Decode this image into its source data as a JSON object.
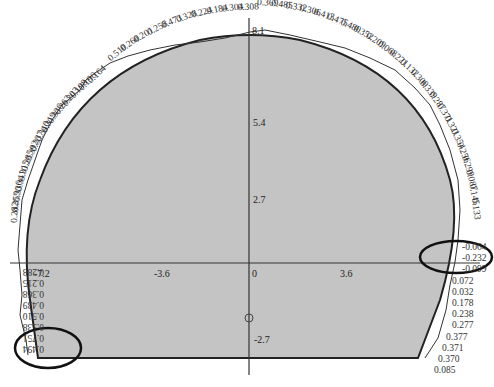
{
  "diagram": {
    "type": "tunnel-cross-section-deformation",
    "colors": {
      "fill": "#c4c4c4",
      "outline": "#222222",
      "axis": "#333333",
      "deformation_line": "#333333",
      "highlight_ellipse": "#111111"
    },
    "axes": {
      "x_ticks": [
        "-7.2",
        "-3.6",
        "0",
        "3.6"
      ],
      "y_ticks": [
        "8.1",
        "5.4",
        "2.7",
        "0",
        "-2.7"
      ],
      "origin_label": "0"
    },
    "labels_left_top": [
      "0.510",
      "0.260",
      "0.201",
      "0.258",
      "0.473",
      "0.328",
      "0.224",
      "0.184",
      "0.304",
      "0.308"
    ],
    "labels_top_right": [
      "0.369",
      "0.485",
      "0.332",
      "0.306",
      "0.413",
      "0.475",
      "0.480",
      "0.352",
      "0.209",
      "0.068",
      "0.221",
      "0.132",
      "0.300",
      "0.339",
      "0.287",
      "0.371",
      "0.321",
      "0.354",
      "0.256",
      "0.299",
      "0.087",
      "0.145",
      "0.133"
    ],
    "labels_right_lower": [
      "-0.064",
      "-0.232",
      "-0.099",
      "0.072",
      "0.032",
      "0.178",
      "0.238",
      "0.277",
      "0.377",
      "0.371",
      "0.370",
      "0.085"
    ],
    "labels_left_upper": [
      "0.164",
      "0.196",
      "0.198",
      "0.203",
      "0.263",
      "0.336",
      "0.319",
      "0.340",
      "0.337",
      "0.392",
      "0.285",
      "0.315",
      "0.341",
      "0.336",
      "0.359",
      "0.282"
    ],
    "labels_left_lower": [
      "0.288",
      "0.215",
      "0.368",
      "0.439",
      "0.510",
      "0.538",
      "0.751",
      "0.494"
    ],
    "highlights": [
      {
        "name": "left-bottom-ellipse",
        "labels": [
          "0.538",
          "0.751",
          "0.494"
        ]
      },
      {
        "name": "right-springline-ellipse",
        "labels": [
          "-0.064",
          "-0.232",
          "-0.099"
        ]
      }
    ]
  }
}
